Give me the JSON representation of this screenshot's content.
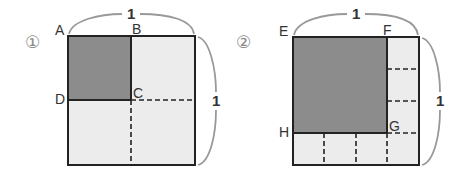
{
  "figures": [
    {
      "id": "figure-1",
      "number_label": "①",
      "side_labels": {
        "top": "1",
        "right": "1"
      },
      "vertices": {
        "A": "A",
        "B": "B",
        "C": "C",
        "D": "D"
      },
      "description": "Unit square divided into 2×2; top-left quarter ABCD shaded"
    },
    {
      "id": "figure-2",
      "number_label": "②",
      "side_labels": {
        "top": "1",
        "right": "1"
      },
      "vertices": {
        "E": "E",
        "F": "F",
        "G": "G",
        "H": "H"
      },
      "description": "Unit square divided into 4×4; top-left 3×3 square EFGH shaded"
    }
  ],
  "colors": {
    "shaded": "#8c8c8c",
    "light": "#ececec",
    "line": "#222222",
    "bracket": "#999999"
  }
}
